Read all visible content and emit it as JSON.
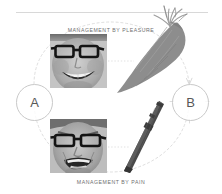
{
  "diagram": {
    "title_top": "MANAGEMENT BY PLEASURE",
    "title_bottom": "MANAGEMENT BY PAIN",
    "node_a_label": "A",
    "node_b_label": "B",
    "icons": {
      "carrot": "carrot-icon",
      "stick": "stick-icon",
      "face_happy": "smiling-face-photo",
      "face_angry": "angry-face-photo",
      "arc_left": "dashed-arc-left",
      "arc_right": "dashed-arc-right",
      "connector_top": "dotted-connector-top",
      "connector_bottom": "dotted-connector-bottom",
      "top_rule": "horizontal-rule"
    },
    "colors": {
      "carrot_body": "#8d8d8d",
      "carrot_leaves": "#9a9a9a",
      "stick": "#4a4a4a",
      "caption_text": "#6f6f6f",
      "circle_stroke": "#c9c9c9",
      "letter_text": "#585858",
      "dashed_line": "#d2d2d2",
      "rule": "#d8d8d8",
      "background": "#ffffff"
    }
  }
}
